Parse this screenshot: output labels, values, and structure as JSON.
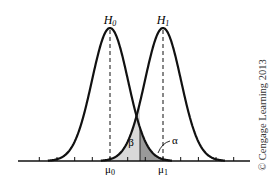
{
  "diagram": {
    "title": "",
    "curves": [
      {
        "id": "H0",
        "label": "H",
        "subscript": "0",
        "mean_label": "μ",
        "mean_sub": "0",
        "mean_x": 110
      },
      {
        "id": "H1",
        "label": "H",
        "subscript": "1",
        "mean_label": "μ",
        "mean_sub": "1",
        "mean_x": 163
      }
    ],
    "regions": {
      "beta": {
        "label": "β",
        "color": "#d9d9d9"
      },
      "alpha": {
        "label": "α",
        "color": "#9a9a9a"
      }
    },
    "critical_value_x": 140,
    "sigma_px": 18,
    "peak_y": 28,
    "baseline_y": 161,
    "axis": {
      "x_start": 18,
      "x_end": 250,
      "tick_spacing": 17.67,
      "tick_count": 13
    },
    "curve_color": "#111111"
  },
  "credit": "© Cengage Learning 2013"
}
